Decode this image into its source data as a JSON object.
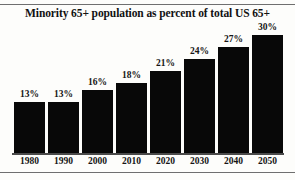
{
  "chart_data": {
    "type": "bar",
    "title": "Minority 65+ population as percent of total US 65+",
    "xlabel": "",
    "ylabel": "",
    "categories": [
      "1980",
      "1990",
      "2000",
      "2010",
      "2020",
      "2030",
      "2040",
      "2050"
    ],
    "values": [
      13,
      13,
      16,
      18,
      21,
      24,
      27,
      30
    ],
    "value_labels": [
      "13%",
      "13%",
      "16%",
      "18%",
      "21%",
      "24%",
      "27%",
      "30%"
    ],
    "ylim": [
      0,
      33
    ],
    "grid": false,
    "legend": null,
    "bar_color": "#080808",
    "background_color": "#fdfdfb",
    "text_color": "#151515",
    "axis_color": "#4a4a4a",
    "rule_color": "#6f6f6f"
  }
}
